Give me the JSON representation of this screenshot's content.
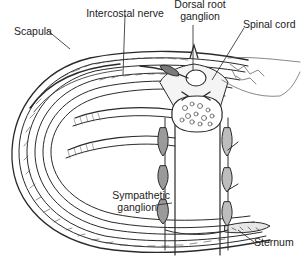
{
  "figure": {
    "cropped_heading_fragment": "",
    "labels": {
      "intercostal_nerve": "Intercostal nerve",
      "dorsal_root_ganglion_line1": "Dorsal root",
      "dorsal_root_ganglion_line2": "ganglion",
      "scapula": "Scapula",
      "spinal_cord": "Spinal cord",
      "sympathetic_ganglion_line1": "Sympathetic",
      "sympathetic_ganglion_line2": "ganglion",
      "sternum": "Sternum"
    },
    "colors": {
      "line": "#2a2a2a",
      "fill_gray": "#9a9a9a",
      "fill_light": "#d8d8d8",
      "background": "#ffffff"
    }
  }
}
